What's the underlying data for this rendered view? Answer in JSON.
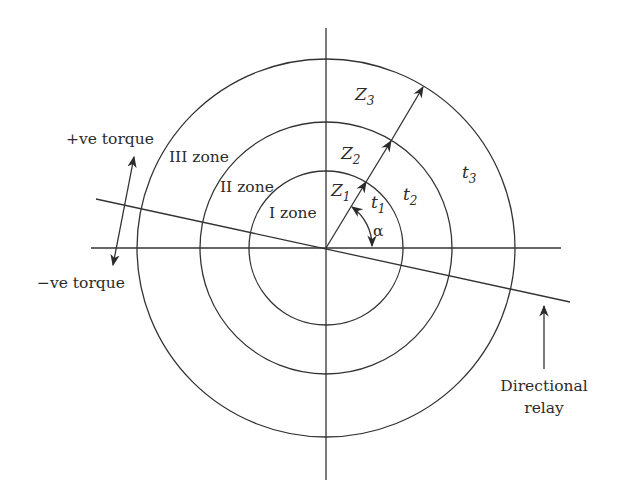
{
  "diagram": {
    "type": "polar zone diagram",
    "center": [
      326,
      248
    ],
    "circles": [
      {
        "name": "I zone",
        "radius": 77
      },
      {
        "name": "II zone",
        "radius": 126
      },
      {
        "name": "III zone",
        "radius": 189
      }
    ],
    "colors": {
      "line": "#333333",
      "text": "#2b2b2b",
      "background": "#ffffff"
    }
  },
  "labels": {
    "zone1": "I zone",
    "zone2": "II zone",
    "zone3": "III zone",
    "z1": {
      "main": "Z",
      "sub": "1"
    },
    "z2": {
      "main": "Z",
      "sub": "2"
    },
    "z3": {
      "main": "Z",
      "sub": "3"
    },
    "t1": {
      "main": "t",
      "sub": "1"
    },
    "t2": {
      "main": "t",
      "sub": "2"
    },
    "t3": {
      "main": "t",
      "sub": "3"
    },
    "alpha": "α",
    "pos_torque": "+ve torque",
    "neg_torque": "−ve torque",
    "directional_line1": "Directional",
    "directional_line2": "relay"
  }
}
